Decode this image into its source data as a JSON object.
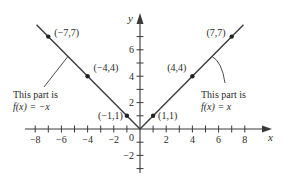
{
  "chart_data": {
    "type": "line",
    "title": "",
    "xlabel": "x",
    "ylabel": "y",
    "xlim": [
      -8.5,
      9.5
    ],
    "ylim": [
      -3.5,
      8.5
    ],
    "grid": false,
    "legend": null,
    "x_ticks": [
      -8,
      -7,
      -6,
      -5,
      -4,
      -3,
      -2,
      -1,
      1,
      2,
      3,
      4,
      5,
      6,
      7,
      8
    ],
    "x_tick_labels": [
      "−8",
      "−6",
      "−4",
      "−2",
      "2",
      "4",
      "6",
      "8"
    ],
    "x_tick_label_values": [
      -8,
      -6,
      -4,
      -2,
      2,
      4,
      6,
      8
    ],
    "y_ticks": [
      -3,
      -2,
      -1,
      1,
      2,
      3,
      4,
      5,
      6,
      7
    ],
    "y_tick_labels": [
      "6",
      "4",
      "2",
      "−2"
    ],
    "y_tick_label_values": [
      6,
      4,
      2,
      -2
    ],
    "origin_label": "0",
    "series": [
      {
        "name": "f(x) = -x",
        "domain": "x < 0",
        "x": [
          -7.9,
          0
        ],
        "y": [
          7.9,
          0
        ],
        "color": "#3a3a3a"
      },
      {
        "name": "f(x) = x",
        "domain": "x >= 0",
        "x": [
          0,
          7.9
        ],
        "y": [
          0,
          7.9
        ],
        "color": "#3a3a3a"
      }
    ],
    "points": [
      {
        "x": -7,
        "y": 7,
        "label": "(−7,7)"
      },
      {
        "x": -4,
        "y": 4,
        "label": "(−4,4)"
      },
      {
        "x": -1,
        "y": 1,
        "label": "(−1,1)"
      },
      {
        "x": 1,
        "y": 1,
        "label": "(1,1)"
      },
      {
        "x": 4,
        "y": 4,
        "label": "(4,4)"
      },
      {
        "x": 7,
        "y": 7,
        "label": "(7,7)"
      }
    ],
    "annotations": [
      {
        "line1": "This part is",
        "line2": "f(x) = −x",
        "points_to": "left branch"
      },
      {
        "line1": "This part is",
        "line2": "f(x) = x",
        "points_to": "right branch"
      }
    ]
  }
}
